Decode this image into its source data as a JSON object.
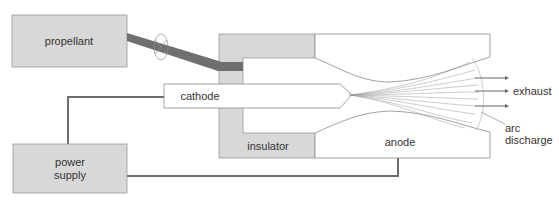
{
  "diagram": {
    "type": "arcjet thruster schematic",
    "labels": {
      "propellant": "propellant",
      "cathode": "cathode",
      "insulator": "insulator",
      "anode": "anode",
      "power_supply_line1": "power",
      "power_supply_line2": "supply",
      "exhaust": "exhaust",
      "arc_discharge_line1": "arc",
      "arc_discharge_line2": "discharge"
    },
    "colors": {
      "component_fill": "#d8d8d8",
      "pipe": "#6f6f6f",
      "wire": "#6e6e6e",
      "outline": "#8a8a8a",
      "text": "#333333"
    },
    "exhaust_arrows": 3
  }
}
